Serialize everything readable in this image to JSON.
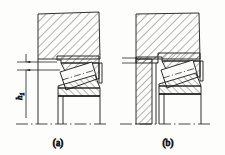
{
  "figure": {
    "type": "engineering-drawing",
    "line_color": "#1a1a1a",
    "hatch_color": "#2b2b2b",
    "background": "#fdfdfc"
  },
  "panels": [
    {
      "id": "a",
      "caption": "(a)",
      "dimension": {
        "label": "h",
        "subscript": "1",
        "name": "shoulder-height"
      },
      "parts": [
        "housing",
        "bearing-outer-ring",
        "tapered-roller",
        "bearing-inner-ring",
        "shaft-centerline"
      ]
    },
    {
      "id": "b",
      "caption": "(b)",
      "parts": [
        "housing",
        "shaft-shoulder",
        "bearing-outer-ring",
        "tapered-roller",
        "bearing-inner-ring",
        "shaft-centerline"
      ]
    }
  ]
}
